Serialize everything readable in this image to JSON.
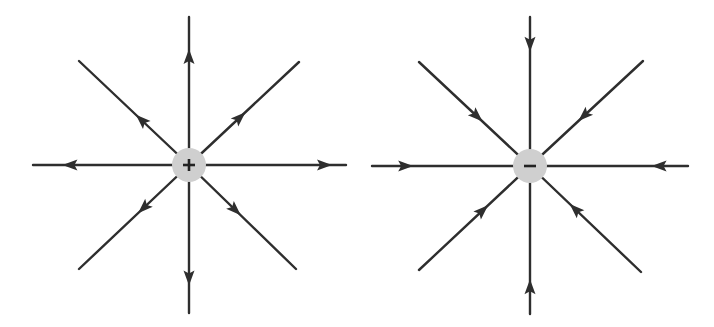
{
  "figure": {
    "panels": [
      {
        "name": "positive-charge",
        "charge_sign": "+",
        "field_direction": "outward",
        "line_count": 8
      },
      {
        "name": "negative-charge",
        "charge_sign": "-",
        "field_direction": "inward",
        "line_count": 8
      }
    ],
    "colors": {
      "line": "#2e2e2e",
      "charge_fill": "#cfcfcf",
      "background": "#ffffff"
    }
  }
}
